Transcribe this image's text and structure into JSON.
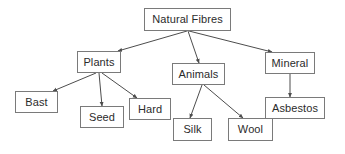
{
  "diagram": {
    "type": "tree",
    "colors": {
      "background": "#ffffff",
      "node_fill": "#ffffff",
      "node_border": "#7a7a7a",
      "text": "#2b2b2b",
      "edge": "#4d4d4d"
    },
    "nodes": [
      {
        "id": "natural-fibres",
        "label": "Natural Fibres",
        "x": 144,
        "y": 8,
        "w": 87,
        "h": 23,
        "level": 0
      },
      {
        "id": "plants",
        "label": "Plants",
        "x": 77,
        "y": 51,
        "w": 44,
        "h": 22,
        "level": 1
      },
      {
        "id": "animals",
        "label": "Animals",
        "x": 172,
        "y": 63,
        "w": 53,
        "h": 22,
        "level": 1
      },
      {
        "id": "mineral",
        "label": "Mineral",
        "x": 265,
        "y": 52,
        "w": 50,
        "h": 22,
        "level": 1
      },
      {
        "id": "bast",
        "label": "Bast",
        "x": 15,
        "y": 91,
        "w": 43,
        "h": 22,
        "level": 2
      },
      {
        "id": "seed",
        "label": "Seed",
        "x": 80,
        "y": 106,
        "w": 44,
        "h": 22,
        "level": 2
      },
      {
        "id": "hard",
        "label": "Hard",
        "x": 129,
        "y": 98,
        "w": 42,
        "h": 22,
        "level": 2
      },
      {
        "id": "silk",
        "label": "Silk",
        "x": 173,
        "y": 118,
        "w": 39,
        "h": 23,
        "level": 2
      },
      {
        "id": "wool",
        "label": "Wool",
        "x": 228,
        "y": 118,
        "w": 45,
        "h": 23,
        "level": 2
      },
      {
        "id": "asbestos",
        "label": "Asbestos",
        "x": 265,
        "y": 97,
        "w": 60,
        "h": 22,
        "level": 2
      }
    ],
    "edges": [
      {
        "id": "edge-natural-fibres-plants",
        "from": "natural-fibres",
        "to": "plants",
        "x1": 187,
        "y1": 31,
        "x2": 118,
        "y2": 51
      },
      {
        "id": "edge-natural-fibres-animals",
        "from": "natural-fibres",
        "to": "animals",
        "x1": 188,
        "y1": 31,
        "x2": 199,
        "y2": 63
      },
      {
        "id": "edge-natural-fibres-mineral",
        "from": "natural-fibres",
        "to": "mineral",
        "x1": 189,
        "y1": 31,
        "x2": 272,
        "y2": 52
      },
      {
        "id": "edge-plants-bast",
        "from": "plants",
        "to": "bast",
        "x1": 96,
        "y1": 73,
        "x2": 53,
        "y2": 91
      },
      {
        "id": "edge-plants-seed",
        "from": "plants",
        "to": "seed",
        "x1": 99,
        "y1": 73,
        "x2": 102,
        "y2": 106
      },
      {
        "id": "edge-plants-hard",
        "from": "plants",
        "to": "hard",
        "x1": 102,
        "y1": 73,
        "x2": 137,
        "y2": 98
      },
      {
        "id": "edge-animals-silk",
        "from": "animals",
        "to": "silk",
        "x1": 202,
        "y1": 85,
        "x2": 190,
        "y2": 118
      },
      {
        "id": "edge-animals-wool",
        "from": "animals",
        "to": "wool",
        "x1": 204,
        "y1": 85,
        "x2": 243,
        "y2": 118
      },
      {
        "id": "edge-mineral-asbestos",
        "from": "mineral",
        "to": "asbestos",
        "x1": 290,
        "y1": 74,
        "x2": 290,
        "y2": 97
      }
    ]
  }
}
